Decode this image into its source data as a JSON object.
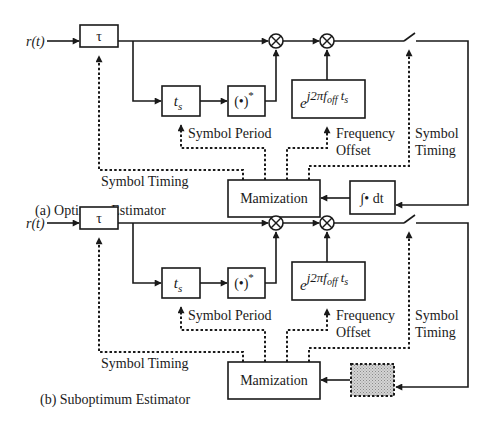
{
  "diagrams": [
    {
      "id": "a",
      "caption": "(a) Optimum Estimator",
      "input_label": "r(t)",
      "delay_block": "τ",
      "period_block": "t",
      "period_block_sub": "s",
      "conjugate_block": "(•)",
      "conjugate_sup": "*",
      "exp_block_base": "e",
      "exp_block_sup_a": "j2πf",
      "exp_block_sup_sub": "off",
      "exp_block_sup_b": " t",
      "exp_block_sup_sub2": "s",
      "maximization_block": "Mamization",
      "integrator_block": "∫• dt",
      "labels": {
        "symbol_period": "Symbol Period",
        "frequency": "Frequency",
        "offset": "Offset",
        "symbol": "Symbol",
        "timing": "Timing",
        "symbol_timing_left": "Symbol Timing"
      }
    },
    {
      "id": "b",
      "caption": "(b) Suboptimum Estimator",
      "input_label": "r(t)",
      "delay_block": "τ",
      "period_block": "t",
      "period_block_sub": "s",
      "conjugate_block": "(•)",
      "conjugate_sup": "*",
      "exp_block_base": "e",
      "exp_block_sup_a": "j2πf",
      "exp_block_sup_sub": "off",
      "exp_block_sup_b": " t",
      "exp_block_sup_sub2": "s",
      "maximization_block": "Mamization",
      "integrator_block": "",
      "labels": {
        "symbol_period": "Symbol Period",
        "frequency": "Frequency",
        "offset": "Offset",
        "symbol": "Symbol",
        "timing": "Timing",
        "symbol_timing_left": "Symbol Timing"
      }
    }
  ],
  "colors": {
    "line": "#1a1a1a",
    "shaded_block": "#c8c8c8"
  }
}
